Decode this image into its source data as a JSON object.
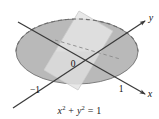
{
  "figure": {
    "caption_parts": {
      "x_var": "x",
      "x_exp": "2",
      "plus": " + ",
      "y_var": "y",
      "y_exp": "2",
      "equals": " = ",
      "value": "1"
    },
    "caption_text": "x2 + y2 = 1",
    "axes": [
      {
        "name": "y-axis",
        "label": "y",
        "label_x": 151,
        "label_y": 20,
        "arrow_dir": "upper-right"
      },
      {
        "name": "x-axis",
        "label": "x",
        "label_x": 149,
        "label_y": 95,
        "arrow_dir": "lower-right"
      }
    ],
    "point_labels": [
      {
        "name": "origin",
        "text": "0",
        "x": 73,
        "y": 66
      },
      {
        "name": "x-negative-one",
        "text": "−1",
        "x": 34,
        "y": 92
      },
      {
        "name": "x-positive-one",
        "text": "1",
        "x": 121,
        "y": 91
      }
    ],
    "colors": {
      "disk_fill": "#b9b9b9",
      "disk_stroke": "#7d7d7d",
      "plane_fill": "#e2e2e2",
      "plane_stroke": "#c4c4c4",
      "axis_stroke": "#3a3a3a",
      "dash_stroke": "#6e6e6e",
      "background": "#ffffff",
      "text": "#111111"
    },
    "geometry": {
      "ellipse": {
        "cx": 77,
        "cy": 51.5,
        "rx": 61,
        "ry": 32.5
      },
      "origin": {
        "x": 77,
        "y": 62
      },
      "plane_apex": {
        "x": 79,
        "y": 11
      }
    }
  }
}
